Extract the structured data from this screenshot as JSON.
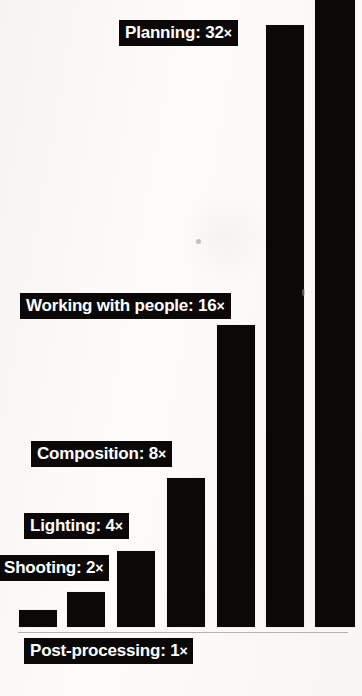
{
  "chart_data": {
    "type": "bar",
    "title": "",
    "subtitle": "",
    "xlabel": "",
    "ylabel": "",
    "grid": false,
    "legend": "none",
    "axis_visible": false,
    "note": "Doubling progression of relative effort/importance; 7th bar is unlabeled and cropped at the top edge.",
    "categories": [
      "Post-processing",
      "Shooting",
      "Lighting",
      "Composition",
      "Working with people",
      "Planning",
      ""
    ],
    "values": [
      1,
      2,
      4,
      8,
      16,
      32,
      64
    ],
    "value_labels": [
      "1 ×",
      "2 ×",
      "4 ×",
      "8 ×",
      "16 ×",
      "32 ×",
      ""
    ],
    "ylim": [
      0,
      64
    ],
    "bar_color": "#0a0908",
    "background_color": "#fbfaf8",
    "label_text_color": "#ffffff",
    "label_box_color": "#0a0908"
  },
  "bars": [
    {
      "name": "post-processing",
      "label_text": "Post-processing: 1",
      "multiplier": "×",
      "value": 1,
      "x": 19,
      "y": 610,
      "w": 38,
      "h": 17,
      "label_x": 24,
      "label_y": 638,
      "has_label": true
    },
    {
      "name": "shooting",
      "label_text": "Shooting: 2",
      "multiplier": "×",
      "value": 2,
      "x": 67,
      "y": 592,
      "w": 38,
      "h": 35,
      "label_x": -2,
      "label_y": 555,
      "has_label": true
    },
    {
      "name": "lighting",
      "label_text": "Lighting: 4",
      "multiplier": "×",
      "value": 4,
      "x": 117,
      "y": 551,
      "w": 38,
      "h": 76,
      "label_x": 24,
      "label_y": 513,
      "has_label": true
    },
    {
      "name": "composition",
      "label_text": "Composition: 8",
      "multiplier": "×",
      "value": 8,
      "x": 167,
      "y": 478,
      "w": 38,
      "h": 149,
      "label_x": 31,
      "label_y": 441,
      "has_label": true
    },
    {
      "name": "working-with-people",
      "label_text": "Working with people: 16",
      "multiplier": "×",
      "value": 16,
      "x": 217,
      "y": 325,
      "w": 38,
      "h": 302,
      "label_x": 20,
      "label_y": 293,
      "has_label": true
    },
    {
      "name": "planning",
      "label_text": "Planning: 32",
      "multiplier": "×",
      "value": 32,
      "x": 266,
      "y": 25,
      "w": 38,
      "h": 602,
      "label_x": 119,
      "label_y": 20,
      "has_label": true
    },
    {
      "name": "unlabeled-top",
      "label_text": "",
      "multiplier": "",
      "value": 64,
      "x": 315,
      "y": -10,
      "w": 40,
      "h": 637,
      "label_x": 0,
      "label_y": 0,
      "has_label": false
    }
  ]
}
